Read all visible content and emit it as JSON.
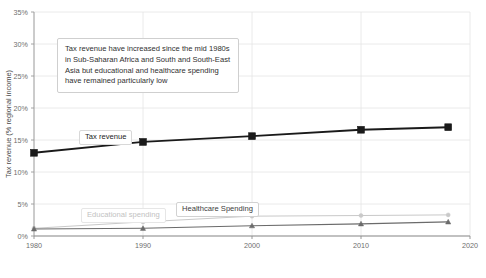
{
  "chart_data": {
    "type": "line",
    "title": "",
    "subtitle": "",
    "xlabel": "",
    "ylabel": "Tax revenue (% regional income)",
    "xlim": [
      1980,
      2020
    ],
    "ylim": [
      0,
      35
    ],
    "grid": true,
    "legend_position": "inline-labels",
    "x": [
      1980,
      1990,
      2000,
      2010,
      2018
    ],
    "xtick_labels": [
      "1980",
      "1990",
      "2000",
      "2010",
      "2020"
    ],
    "xticks": [
      1980,
      1990,
      2000,
      2010,
      2020
    ],
    "ytick_labels": [
      "0%",
      "5%",
      "10%",
      "15%",
      "20%",
      "25%",
      "30%",
      "35%"
    ],
    "yticks": [
      0,
      5,
      10,
      15,
      20,
      25,
      30,
      35
    ],
    "series": [
      {
        "name": "Tax revenue",
        "color": "#1a1a1a",
        "marker": "square",
        "values": [
          13.0,
          14.7,
          15.6,
          16.6,
          17.0
        ]
      },
      {
        "name": "Educational spending",
        "color": "#c9c9c9",
        "marker": "circle",
        "values": [
          1.2,
          2.2,
          3.1,
          3.2,
          3.3
        ]
      },
      {
        "name": "Healthcare Spending",
        "color": "#6b6b6b",
        "marker": "triangle",
        "values": [
          1.1,
          1.2,
          1.6,
          1.9,
          2.2
        ]
      }
    ],
    "annotations": [
      {
        "id": "main-note",
        "text": "Tax revenue have increased since the mid 1980s\nin Sub-Saharan Africa and South and South-East\nAsia but educational and healthcare spending\nhave remained particularly low"
      }
    ]
  },
  "colors": {
    "background": "#ffffff",
    "grid": "#e4e4e4",
    "axis": "#9a9a9a",
    "tick_text": "#6e6e6e",
    "tax_revenue": "#1a1a1a",
    "educational_spending": "#c9c9c9",
    "healthcare_spending": "#6b6b6b"
  }
}
